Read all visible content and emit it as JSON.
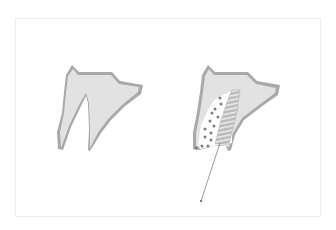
{
  "figure": {
    "panels": [
      {
        "id": "left",
        "label": "tooth-socket-before",
        "description": "Bone cross-section with empty extraction socket"
      },
      {
        "id": "right",
        "label": "tooth-socket-with-implant",
        "description": "Bone cross-section with threaded implant and bone graft particles, leader line pointing down"
      }
    ],
    "colors": {
      "background": "#ffffff",
      "frame_border": "#ececec",
      "bone_fill": "#e2e2e2",
      "cortical_outline": "#a9a9a9",
      "implant_fill": "#bdbdbd",
      "implant_thread": "#f2f2f2",
      "graft_dots": "#7d7d7d",
      "leader_line": "#6e6e6e"
    }
  }
}
